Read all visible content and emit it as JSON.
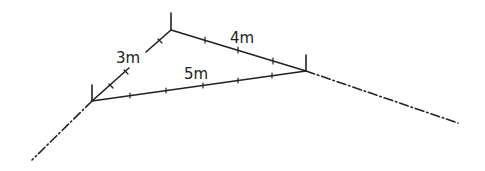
{
  "diagram": {
    "type": "right-triangle-rope",
    "colors": {
      "stroke": "#222222",
      "background": "#ffffff"
    },
    "vertices": {
      "left": {
        "x": 92,
        "y": 101
      },
      "top": {
        "x": 171,
        "y": 30
      },
      "right": {
        "x": 306,
        "y": 71
      }
    },
    "sides": [
      {
        "id": "side-3m",
        "label": "3m",
        "from": "left",
        "to": "top",
        "label_x": 116,
        "label_y": 63
      },
      {
        "id": "side-4m",
        "label": "4m",
        "from": "top",
        "to": "right",
        "label_x": 230,
        "label_y": 43
      },
      {
        "id": "side-5m",
        "label": "5m",
        "from": "left",
        "to": "right",
        "label_x": 184,
        "label_y": 79
      }
    ],
    "extension_lines": [
      {
        "id": "ext-left",
        "x1": 92,
        "y1": 101,
        "x2": 32,
        "y2": 160
      },
      {
        "id": "ext-right",
        "x1": 306,
        "y1": 71,
        "x2": 458,
        "y2": 123
      }
    ]
  }
}
